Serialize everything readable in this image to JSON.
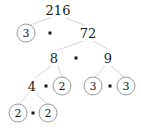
{
  "figure": {
    "type": "factor-tree",
    "root_value": "216",
    "edge_color": "#c8c8c8",
    "circle_color": "#9a9a9a",
    "text_color": "#1a1a1a",
    "background": "#ffffff",
    "operator_symbol": "·"
  },
  "nodes": [
    {
      "id": "n216",
      "label": "216",
      "circled": false,
      "x": 58,
      "y": 10
    },
    {
      "id": "n3a",
      "label": "3",
      "circled": true,
      "x": 26,
      "y": 33
    },
    {
      "id": "n72",
      "label": "72",
      "circled": false,
      "x": 88,
      "y": 33
    },
    {
      "id": "n8",
      "label": "8",
      "circled": false,
      "x": 54,
      "y": 58
    },
    {
      "id": "n9",
      "label": "9",
      "circled": false,
      "x": 108,
      "y": 58
    },
    {
      "id": "n4",
      "label": "4",
      "circled": false,
      "x": 32,
      "y": 86
    },
    {
      "id": "n2a",
      "label": "2",
      "circled": true,
      "x": 62,
      "y": 86
    },
    {
      "id": "n3b",
      "label": "3",
      "circled": true,
      "x": 93,
      "y": 86
    },
    {
      "id": "n3c",
      "label": "3",
      "circled": true,
      "x": 126,
      "y": 86
    },
    {
      "id": "n2b",
      "label": "2",
      "circled": true,
      "x": 18,
      "y": 113
    },
    {
      "id": "n2c",
      "label": "2",
      "circled": true,
      "x": 48,
      "y": 113
    }
  ],
  "operators": [
    {
      "id": "op1",
      "symbol": "·",
      "x": 50,
      "y": 33
    },
    {
      "id": "op2",
      "symbol": "·",
      "x": 76,
      "y": 58
    },
    {
      "id": "op3",
      "symbol": "·",
      "x": 46,
      "y": 86
    },
    {
      "id": "op4",
      "symbol": "·",
      "x": 110,
      "y": 86
    },
    {
      "id": "op5",
      "symbol": "·",
      "x": 33,
      "y": 113
    }
  ],
  "edges": [
    {
      "id": "e1",
      "from": "n216",
      "to": "n3a",
      "x1": 50,
      "y1": 18,
      "x2": 30,
      "y2": 25
    },
    {
      "id": "e2",
      "from": "n216",
      "to": "n72",
      "x1": 66,
      "y1": 18,
      "x2": 84,
      "y2": 25
    },
    {
      "id": "e3",
      "from": "n72",
      "to": "n8",
      "x1": 83,
      "y1": 41,
      "x2": 58,
      "y2": 50
    },
    {
      "id": "e4",
      "from": "n72",
      "to": "n9",
      "x1": 93,
      "y1": 41,
      "x2": 110,
      "y2": 50
    },
    {
      "id": "e5",
      "from": "n8",
      "to": "n4",
      "x1": 51,
      "y1": 66,
      "x2": 35,
      "y2": 78
    },
    {
      "id": "e6",
      "from": "n8",
      "to": "n2a",
      "x1": 58,
      "y1": 66,
      "x2": 62,
      "y2": 77
    },
    {
      "id": "e7",
      "from": "n9",
      "to": "n3b",
      "x1": 105,
      "y1": 66,
      "x2": 95,
      "y2": 77
    },
    {
      "id": "e8",
      "from": "n9",
      "to": "n3c",
      "x1": 111,
      "y1": 66,
      "x2": 124,
      "y2": 77
    },
    {
      "id": "e9",
      "from": "n4",
      "to": "n2b",
      "x1": 29,
      "y1": 93,
      "x2": 19,
      "y2": 104
    },
    {
      "id": "e10",
      "from": "n4",
      "to": "n2c",
      "x1": 36,
      "y1": 93,
      "x2": 47,
      "y2": 104
    }
  ],
  "factorization": {
    "expression": "216 = 3 · 72 = 3 · 8 · 9 = 2 · 2 · 2 · 3 · 3 · 3",
    "primes": [
      "2",
      "2",
      "2",
      "3",
      "3",
      "3"
    ]
  }
}
